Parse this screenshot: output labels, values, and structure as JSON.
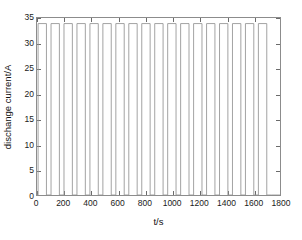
{
  "chart_data": {
    "type": "line",
    "title": "",
    "subtitle": "",
    "xlabel": "t/s",
    "ylabel": "dischange current/A",
    "xlim": [
      0,
      1800
    ],
    "ylim": [
      0,
      35
    ],
    "xticks": [
      0,
      200,
      400,
      600,
      800,
      1000,
      1200,
      1400,
      1600,
      1800
    ],
    "xtick_labels": [
      "0",
      "200",
      "400",
      "600",
      "800",
      "1000",
      "1200",
      "1400",
      "1600",
      "1800"
    ],
    "yticks": [
      0,
      5,
      10,
      15,
      20,
      25,
      30,
      35
    ],
    "ytick_labels": [
      "0",
      "5",
      "10",
      "15",
      "20",
      "25",
      "30",
      "35"
    ],
    "grid": false,
    "legend": null,
    "legend_position": "none",
    "annotations": [],
    "waveform": {
      "description": "square-wave pulsed discharge current",
      "pulse_count": 18,
      "period_s": 96,
      "pulse_on_s": 62,
      "pulse_off_s": 34,
      "first_pulse_start_s": 8,
      "high_value_A": 33.9,
      "low_value_A": 0
    },
    "series": [
      {
        "name": "discharge current",
        "color": "#999999",
        "x": [
          0,
          8,
          8,
          70,
          70,
          104,
          104,
          166,
          166,
          200,
          200,
          262,
          262,
          296,
          296,
          358,
          358,
          392,
          392,
          454,
          454,
          488,
          488,
          550,
          550,
          584,
          584,
          646,
          646,
          680,
          680,
          742,
          742,
          776,
          776,
          838,
          838,
          872,
          872,
          934,
          934,
          968,
          968,
          1030,
          1030,
          1064,
          1064,
          1126,
          1126,
          1160,
          1160,
          1222,
          1222,
          1256,
          1256,
          1318,
          1318,
          1352,
          1352,
          1414,
          1414,
          1448,
          1448,
          1510,
          1510,
          1544,
          1544,
          1606,
          1606,
          1640,
          1640,
          1702,
          1702,
          1736,
          1736,
          1800
        ],
        "y": [
          0,
          0,
          33.9,
          33.9,
          0,
          0,
          33.9,
          33.9,
          0,
          0,
          33.9,
          33.9,
          0,
          0,
          33.9,
          33.9,
          0,
          0,
          33.9,
          33.9,
          0,
          0,
          33.9,
          33.9,
          0,
          0,
          33.9,
          33.9,
          0,
          0,
          33.9,
          33.9,
          0,
          0,
          33.9,
          33.9,
          0,
          0,
          33.9,
          33.9,
          0,
          0,
          33.9,
          33.9,
          0,
          0,
          33.9,
          33.9,
          0,
          0,
          33.9,
          33.9,
          0,
          0,
          33.9,
          33.9,
          0,
          0,
          33.9,
          33.9,
          0,
          0,
          33.9,
          33.9,
          0,
          0,
          33.9,
          33.9,
          0,
          0,
          33.9,
          33.9,
          0,
          0,
          0,
          0
        ]
      }
    ]
  },
  "axis_label_x": "t/s",
  "axis_label_y": "dischange current/A"
}
